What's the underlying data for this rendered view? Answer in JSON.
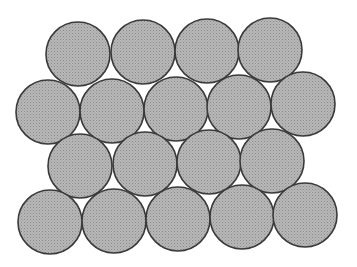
{
  "diagram": {
    "style": {
      "background": "#ffffff",
      "fill": "#b8b8b8",
      "fill_dot": "#8a8a8a",
      "stroke": "#3a3a3a",
      "stroke_width": 1.6,
      "radius": 32
    },
    "rows": [
      {
        "count": 4,
        "centers": [
          [
            78,
            54
          ],
          [
            143,
            52
          ],
          [
            207,
            51
          ],
          [
            270,
            50
          ]
        ]
      },
      {
        "count": 5,
        "centers": [
          [
            48,
            112
          ],
          [
            112,
            111
          ],
          [
            176,
            109
          ],
          [
            239,
            107
          ],
          [
            303,
            104
          ]
        ]
      },
      {
        "count": 4,
        "centers": [
          [
            80,
            166
          ],
          [
            145,
            164
          ],
          [
            209,
            162
          ],
          [
            272,
            161
          ]
        ]
      },
      {
        "count": 5,
        "centers": [
          [
            50,
            222
          ],
          [
            114,
            221
          ],
          [
            178,
            219
          ],
          [
            242,
            217
          ],
          [
            305,
            215
          ]
        ]
      }
    ]
  }
}
